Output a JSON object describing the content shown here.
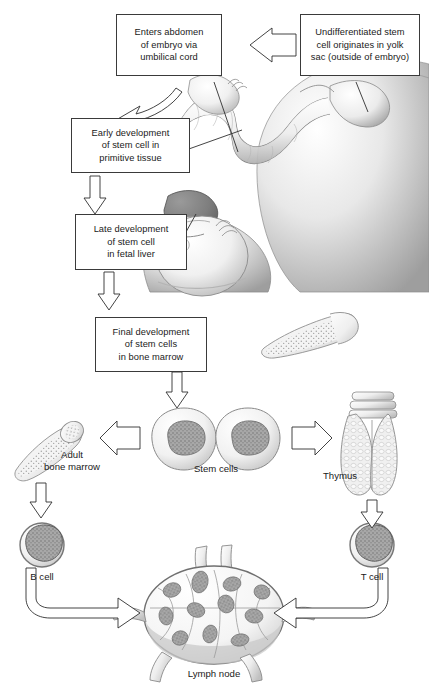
{
  "figure": {
    "boxes": [
      {
        "id": "enters-abdomen",
        "text": "Enters abdomen\nof embryo via\numbilical cord"
      },
      {
        "id": "undifferentiated-stem-cell",
        "text": "Undifferentiated stem\ncell originates in yolk\nsac (outside of embryo)"
      },
      {
        "id": "early-development",
        "text": "Early development\nof stem cell in\nprimitive tissue"
      },
      {
        "id": "late-development",
        "text": "Late development\nof stem cell\nin fetal liver"
      },
      {
        "id": "final-development",
        "text": "Final development\nof stem cells\nin bone marrow"
      }
    ],
    "labels": [
      {
        "id": "adult-bone-marrow",
        "text": "Adult\nbone marrow"
      },
      {
        "id": "stem-cells",
        "text": "Stem cells"
      },
      {
        "id": "thymus",
        "text": "Thymus"
      },
      {
        "id": "b-cell",
        "text": "B cell"
      },
      {
        "id": "t-cell",
        "text": "T cell"
      },
      {
        "id": "lymph-node",
        "text": "Lymph node"
      }
    ],
    "colors": {
      "background": "#ffffff",
      "outline": "#3a3a3a",
      "text": "#1a1a1a",
      "art_light": "#f2f2f2",
      "art_mid": "#c9c9c9",
      "art_dark": "#8a8a8a",
      "art_shadow": "#6b6b6b"
    }
  }
}
